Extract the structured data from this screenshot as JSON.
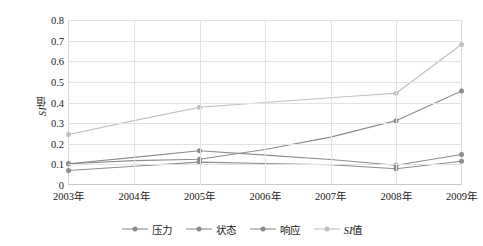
{
  "chart_data": {
    "type": "line",
    "title": "",
    "xlabel": "",
    "ylabel": "SI值",
    "categories": [
      "2003年",
      "2004年",
      "2005年",
      "2006年",
      "2007年",
      "2008年",
      "2009年"
    ],
    "ylim": [
      0,
      0.8
    ],
    "ytick_labels": [
      "0",
      "0.1",
      "0.2",
      "0.3",
      "0.4",
      "0.5",
      "0.6",
      "0.7",
      "0.8"
    ],
    "ytick_values": [
      0,
      0.1,
      0.2,
      0.3,
      0.4,
      0.5,
      0.6,
      0.7,
      0.8
    ],
    "grid": true,
    "legend_position": "bottom",
    "series": [
      {
        "name": "压力",
        "color": "#8c8c8c",
        "marker": "circle",
        "values": [
          0.103,
          0.118,
          0.125,
          0.172,
          0.232,
          0.312,
          0.456
        ],
        "marker_at": [
          true,
          false,
          true,
          false,
          false,
          true,
          true
        ]
      },
      {
        "name": "状态",
        "color": "#8c8c8c",
        "marker": "circle",
        "values": [
          0.07,
          0.091,
          0.111,
          0.104,
          0.098,
          0.079,
          0.115
        ],
        "marker_at": [
          true,
          false,
          true,
          false,
          false,
          true,
          true
        ]
      },
      {
        "name": "响应",
        "color": "#8c8c8c",
        "marker": "circle",
        "values": [
          0.103,
          0.134,
          0.166,
          0.145,
          0.124,
          0.096,
          0.148
        ],
        "marker_at": [
          true,
          false,
          true,
          false,
          false,
          true,
          true
        ]
      },
      {
        "name": "SI值",
        "color": "#bfbfbf",
        "marker": "circle",
        "values": [
          0.245,
          0.312,
          0.377,
          0.4,
          0.423,
          0.445,
          0.681
        ],
        "marker_at": [
          true,
          false,
          true,
          false,
          false,
          true,
          true
        ]
      }
    ]
  },
  "legend": {
    "items": [
      {
        "label_main": "压力",
        "label_italic": ""
      },
      {
        "label_main": "状态",
        "label_italic": ""
      },
      {
        "label_main": "响应",
        "label_italic": ""
      },
      {
        "label_main": "值",
        "label_italic": "SI"
      }
    ]
  },
  "axis_title": {
    "y_italic": "SI",
    "y_main": "值"
  }
}
